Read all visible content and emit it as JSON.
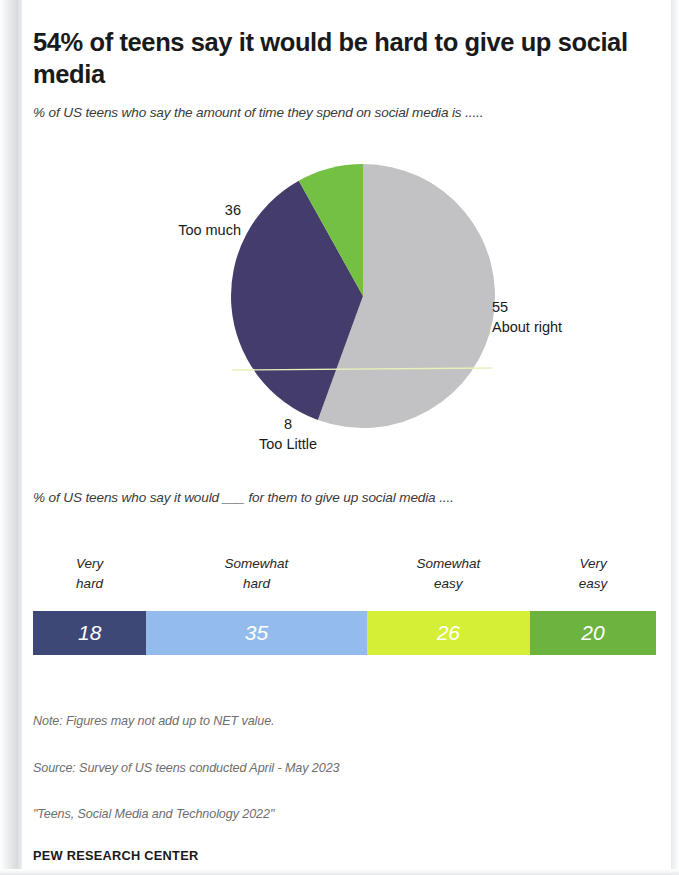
{
  "title": "54% of teens say it would be hard to give up social media",
  "subtitle_pie": "% of US teens who say the amount of time they spend on social media is .....",
  "subtitle_bar": "% of US teens who say it would ___ for them to give up social media ....",
  "footer": {
    "note": "Note: Figures may not add up to NET value.",
    "source": "Source: Survey of US teens conducted April - May 2023",
    "report": "\"Teens, Social Media and Technology 2022\"",
    "brand": "PEW RESEARCH CENTER"
  },
  "chart_data": [
    {
      "type": "pie",
      "title": "% of US teens who say the amount of time they spend on social media is .....",
      "categories": [
        "About right",
        "Too much",
        "Too Little"
      ],
      "values": [
        55,
        36,
        8
      ],
      "colors": [
        "#c2c2c4",
        "#443d6b",
        "#74c043"
      ],
      "labels": [
        {
          "value": "55",
          "name": "About right",
          "position": "right"
        },
        {
          "value": "36",
          "name": "Too much",
          "position": "left"
        },
        {
          "value": "8",
          "name": "Too Little",
          "position": "bottom"
        }
      ],
      "start_angle_deg": 0,
      "direction": "clockwise",
      "legend": "none",
      "grid": false
    },
    {
      "type": "bar",
      "subtype": "stacked-horizontal-100",
      "title": "% of US teens who say it would ___ for them to give up social media ....",
      "categories": [
        "Very hard",
        "Somewhat hard",
        "Somewhat easy",
        "Very easy"
      ],
      "category_lines": [
        [
          "Very",
          "hard"
        ],
        [
          "Somewhat",
          "hard"
        ],
        [
          "Somewhat",
          "easy"
        ],
        [
          "Very",
          "easy"
        ]
      ],
      "values": [
        18,
        35,
        26,
        20
      ],
      "colors": [
        "#3e4876",
        "#93bbec",
        "#d5ee36",
        "#6cb33f"
      ],
      "xlim": [
        0,
        99
      ],
      "grid": false,
      "legend": "above-segments"
    }
  ]
}
